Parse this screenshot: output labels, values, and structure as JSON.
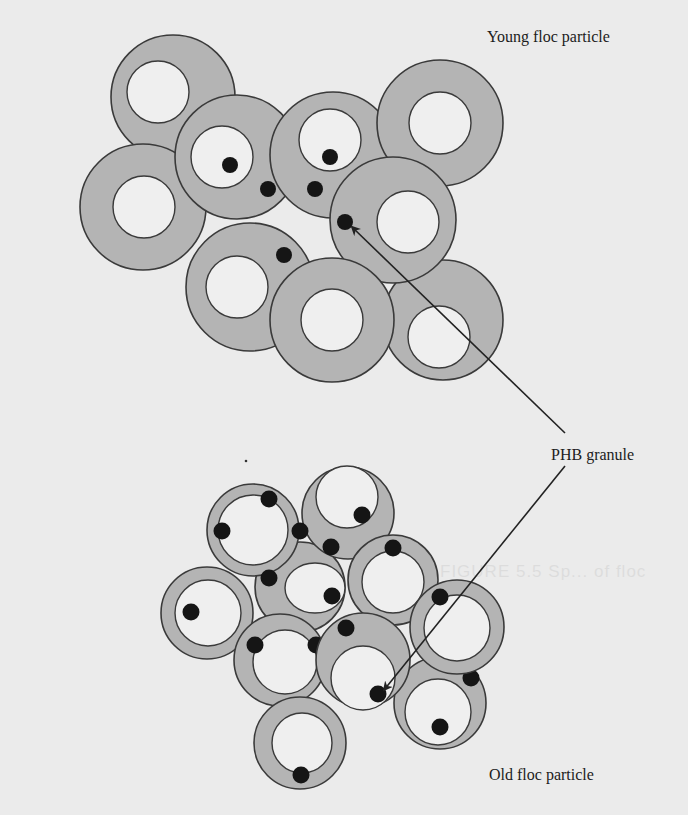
{
  "diagram": {
    "labels": {
      "young_floc": "Young floc particle",
      "phb_granule": "PHB granule",
      "old_floc": "Old floc particle"
    },
    "bleed_through_text": "FIGURE 5.5 Sp... of floc",
    "colors": {
      "background": "#ebebeb",
      "cell_wall": "#b4b4b4",
      "cell_interior": "#efefef",
      "outline": "#3a3a3a",
      "phb_granule": "#151515",
      "arrow": "#222222"
    },
    "young_floc": {
      "cells": [
        {
          "id": "y1",
          "granules": 0
        },
        {
          "id": "y2",
          "granules": 0
        },
        {
          "id": "y3",
          "granules": 2
        },
        {
          "id": "y4",
          "granules": 2
        },
        {
          "id": "y5",
          "granules": 0
        },
        {
          "id": "y6",
          "granules": 1
        },
        {
          "id": "y7",
          "granules": 0
        },
        {
          "id": "y8",
          "granules": 1
        },
        {
          "id": "y9",
          "granules": 0
        }
      ]
    },
    "old_floc": {
      "cells": [
        {
          "id": "o1",
          "granules": 4
        },
        {
          "id": "o2",
          "granules": 2
        },
        {
          "id": "o3",
          "granules": 1
        },
        {
          "id": "o4",
          "granules": 1
        },
        {
          "id": "o5",
          "granules": 1
        },
        {
          "id": "o6",
          "granules": 2
        },
        {
          "id": "o7",
          "granules": 2
        },
        {
          "id": "o8",
          "granules": 2
        },
        {
          "id": "o9",
          "granules": 2
        },
        {
          "id": "o10",
          "granules": 1
        }
      ]
    },
    "arrows": [
      {
        "from": "phb_granule_label",
        "to": "young_floc_granule"
      },
      {
        "from": "phb_granule_label",
        "to": "old_floc_granule"
      }
    ]
  }
}
